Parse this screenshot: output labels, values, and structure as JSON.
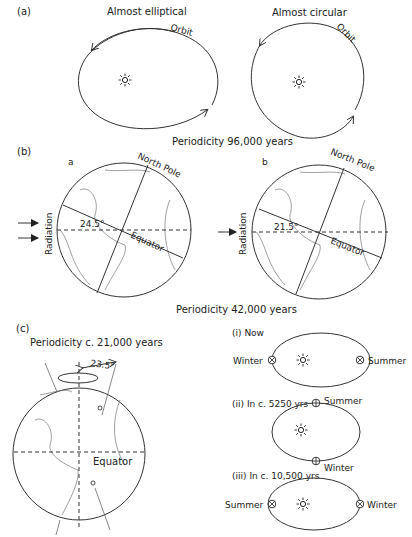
{
  "panel_a": {
    "label": "(a)",
    "left_title": "Almost elliptical",
    "right_title": "Almost circular",
    "orbit_label": "Orbit",
    "periodicity": "Periodicity 96,000 years"
  },
  "panel_b": {
    "label": "(b)",
    "sub_a": "a",
    "sub_b": "b",
    "north_pole": "North Pole",
    "equator": "Equator",
    "radiation": "Radiation",
    "angle_a": "24.5°",
    "angle_b": "21.5°",
    "periodicity": "Periodicity 42,000 years"
  },
  "panel_c": {
    "label": "(c)",
    "periodicity": "Periodicity c. 21,000 years",
    "angle": "23.5°",
    "equator": "Equator",
    "states": [
      {
        "label": "(i) Now",
        "left": "Winter",
        "right": "Summer"
      },
      {
        "label": "(ii) In c. 5250 yrs",
        "top": "Summer",
        "bottom": "Winter"
      },
      {
        "label": "(iii) In c. 10,500 yrs",
        "left": "Summer",
        "right": "Winter"
      }
    ]
  }
}
